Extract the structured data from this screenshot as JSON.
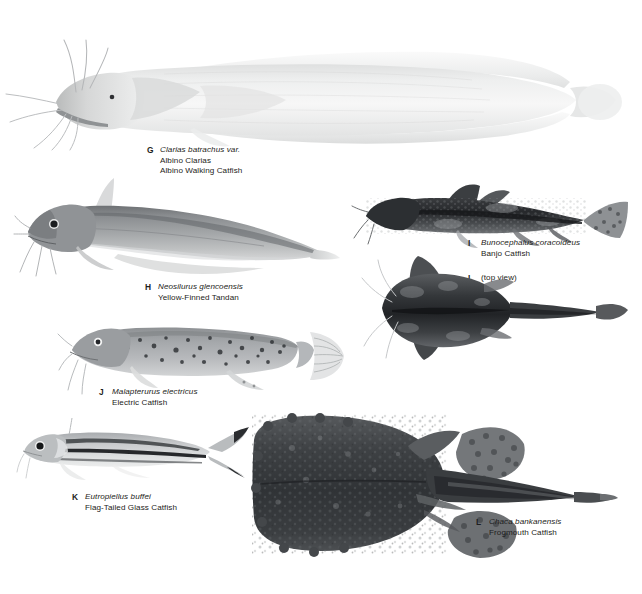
{
  "page": {
    "kind": "field-guide-plate",
    "background_color": "#ffffff",
    "text_color": "#1d1d20",
    "width": 642,
    "height": 594
  },
  "specimens": [
    {
      "letter": "G",
      "scientific_name": "Clarias batrachus var.",
      "common_names": [
        "Albino Clarias",
        "Albino Walking Catfish"
      ],
      "view": "lateral",
      "tone": "very pale grey-white",
      "icon": "albino-walking-catfish"
    },
    {
      "letter": "H",
      "scientific_name": "Neosilurus glencoensis",
      "common_names": [
        "Yellow-Finned Tandan"
      ],
      "view": "lateral",
      "tone": "medium grey",
      "icon": "yellow-finned-tandan"
    },
    {
      "letter": "I",
      "scientific_name": "Bunocephalus coracoideus",
      "common_names": [
        "Banjo Catfish"
      ],
      "view": "lateral",
      "tone": "dark mottled",
      "icon": "banjo-catfish-side"
    },
    {
      "letter": "I",
      "scientific_name": "",
      "common_names": [
        "(top view)"
      ],
      "view": "dorsal",
      "tone": "dark mottled",
      "icon": "banjo-catfish-top"
    },
    {
      "letter": "J",
      "scientific_name": "Malapterurus electricus",
      "common_names": [
        "Electric Catfish"
      ],
      "view": "lateral",
      "tone": "grey with dark speckles",
      "icon": "electric-catfish"
    },
    {
      "letter": "K",
      "scientific_name": "Eutropiellus buffei",
      "common_names": [
        "Flag-Tailed Glass Catfish"
      ],
      "view": "lateral",
      "tone": "silver with dark stripes",
      "icon": "flag-tailed-glass-catfish"
    },
    {
      "letter": "L",
      "scientific_name": "Chaca bankanensis",
      "common_names": [
        "Frogmouth Catfish"
      ],
      "view": "dorsal",
      "tone": "very dark warty",
      "icon": "frogmouth-catfish"
    }
  ],
  "captions": {
    "g": {
      "letter": "G",
      "l1": "Clarias batrachus var.",
      "l2": "Albino Clarias",
      "l3": "Albino Walking Catfish"
    },
    "h": {
      "letter": "H",
      "l1": "Neosilurus glencoensis",
      "l2": "Yellow-Finned Tandan"
    },
    "i": {
      "letter": "I",
      "l1": "Bunocephalus coracoideus",
      "l2": "Banjo Catfish"
    },
    "i_top": {
      "letter": "I",
      "l1": "(top view)"
    },
    "j": {
      "letter": "J",
      "l1": "Malapterurus electricus",
      "l2": "Electric Catfish"
    },
    "k": {
      "letter": "K",
      "l1": "Eutropiellus buffei",
      "l2": "Flag-Tailed Glass Catfish"
    },
    "l": {
      "letter": "L",
      "l1": "Chaca bankanensis",
      "l2": "Frogmouth Catfish"
    }
  },
  "colors": {
    "page_white": "#ffffff",
    "ink": "#1d1d20",
    "pale_body": "#e9eaea",
    "mid_grey": "#9b9ea1",
    "dark_grey": "#4a4d50",
    "near_black": "#24262a"
  }
}
